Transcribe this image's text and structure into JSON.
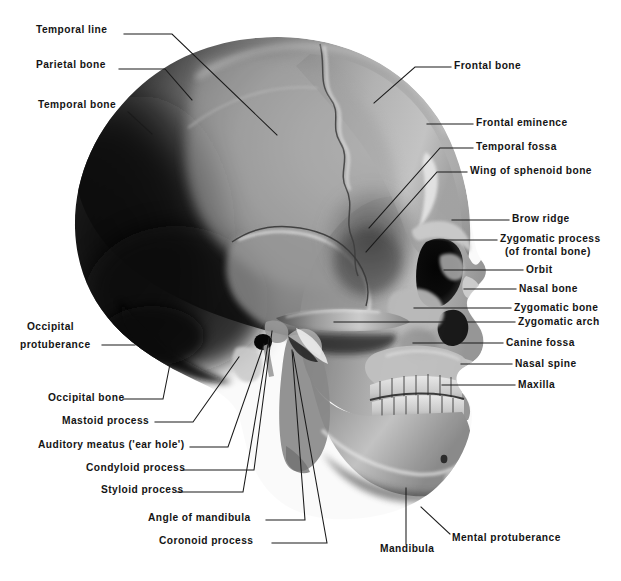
{
  "figure": {
    "width": 621,
    "height": 581,
    "background_color": "#ffffff",
    "text_color": "#141414",
    "leader_line_color": "#1a1a1a",
    "illustration_style": "grayscale airbrush / halftone anatomical plate"
  },
  "labels_left": [
    {
      "id": "temporal-line",
      "text": "Temporal line",
      "x": 36,
      "y": 30,
      "align": "left"
    },
    {
      "id": "parietal-bone",
      "text": "Parietal bone",
      "x": 36,
      "y": 65,
      "align": "left"
    },
    {
      "id": "temporal-bone",
      "text": "Temporal bone",
      "x": 38,
      "y": 105,
      "align": "left"
    },
    {
      "id": "occipital-line1",
      "text": "Occipital",
      "x": 27,
      "y": 327,
      "align": "left"
    },
    {
      "id": "occipital-line2",
      "text": "protuberance",
      "x": 20,
      "y": 345,
      "align": "left"
    },
    {
      "id": "occipital-bone",
      "text": "Occipital bone",
      "x": 48,
      "y": 398,
      "align": "left"
    },
    {
      "id": "mastoid-process",
      "text": "Mastoid process",
      "x": 62,
      "y": 421,
      "align": "left"
    },
    {
      "id": "auditory-meatus",
      "text": "Auditory meatus ('ear hole')",
      "x": 38,
      "y": 445,
      "align": "left"
    },
    {
      "id": "condyloid-process",
      "text": "Condyloid process",
      "x": 86,
      "y": 468,
      "align": "left"
    },
    {
      "id": "styloid-process",
      "text": "Styloid process",
      "x": 101,
      "y": 490,
      "align": "left"
    },
    {
      "id": "angle-of-mandibula",
      "text": "Angle of mandibula",
      "x": 148,
      "y": 518,
      "align": "left"
    },
    {
      "id": "coronoid-process",
      "text": "Coronoid process",
      "x": 159,
      "y": 541,
      "align": "left"
    }
  ],
  "labels_right": [
    {
      "id": "frontal-bone",
      "text": "Frontal bone",
      "x": 454,
      "y": 65,
      "align": "left"
    },
    {
      "id": "frontal-eminence",
      "text": "Frontal eminence",
      "x": 476,
      "y": 121,
      "align": "left"
    },
    {
      "id": "temporal-fossa",
      "text": "Temporal fossa",
      "x": 476,
      "y": 145,
      "align": "left"
    },
    {
      "id": "wing-of-sphenoid",
      "text": "Wing of sphenoid bone",
      "x": 470,
      "y": 169,
      "align": "left"
    },
    {
      "id": "brow-ridge",
      "text": "Brow ridge",
      "x": 512,
      "y": 217,
      "align": "left"
    },
    {
      "id": "zygomatic-process-1",
      "text": "Zygomatic process",
      "x": 500,
      "y": 237,
      "align": "left"
    },
    {
      "id": "zygomatic-process-2",
      "text": "(of frontal bone)",
      "x": 505,
      "y": 250,
      "align": "left"
    },
    {
      "id": "orbit",
      "text": "Orbit",
      "x": 526,
      "y": 268,
      "align": "left"
    },
    {
      "id": "nasal-bone",
      "text": "Nasal bone",
      "x": 519,
      "y": 287,
      "align": "left"
    },
    {
      "id": "zygomatic-bone",
      "text": "Zygomatic bone",
      "x": 514,
      "y": 306,
      "align": "left"
    },
    {
      "id": "zygomatic-arch",
      "text": "Zygomatic arch",
      "x": 518,
      "y": 320,
      "align": "left"
    },
    {
      "id": "canine-fossa",
      "text": "Canine fossa",
      "x": 506,
      "y": 341,
      "align": "left"
    },
    {
      "id": "nasal-spine",
      "text": "Nasal spine",
      "x": 515,
      "y": 362,
      "align": "left"
    },
    {
      "id": "maxilla",
      "text": "Maxilla",
      "x": 518,
      "y": 383,
      "align": "left"
    }
  ],
  "labels_bottom": [
    {
      "id": "mandibula",
      "text": "Mandibula",
      "x": 380,
      "y": 549,
      "align": "left"
    },
    {
      "id": "mental-protuberance",
      "text": "Mental protuberance",
      "x": 452,
      "y": 538,
      "align": "left"
    }
  ],
  "leader_lines": [
    {
      "id": "leader-temporal-line",
      "points": "124,34 172,34 277,135"
    },
    {
      "id": "leader-parietal-bone",
      "points": "119,69 165,69 192,100"
    },
    {
      "id": "leader-temporal-bone",
      "points": "128,112 150,132"
    },
    {
      "id": "leader-occipital-prot",
      "points": "102,345 135,345"
    },
    {
      "id": "leader-occipital-bone",
      "points": "123,399 163,399 168,366"
    },
    {
      "id": "leader-mastoid-process",
      "points": "155,422 193,422 238,358"
    },
    {
      "id": "leader-auditory-meatus",
      "points": "190,447 228,447 265,343"
    },
    {
      "id": "leader-condyloid-process",
      "points": "183,470 254,470 273,330"
    },
    {
      "id": "leader-styloid-process",
      "points": "177,492 243,492 270,337"
    },
    {
      "id": "leader-angle-mandibula",
      "points": "266,520 305,520 320,346"
    },
    {
      "id": "leader-coronoid-process",
      "points": "272,543 327,543 288,347"
    },
    {
      "id": "leader-frontal-bone",
      "points": "451,67 415,67 374,103"
    },
    {
      "id": "leader-frontal-eminence",
      "points": "473,124 427,124"
    },
    {
      "id": "leader-temporal-fossa",
      "points": "473,148 440,148 369,228"
    },
    {
      "id": "leader-wing-sphenoid",
      "points": "467,172 437,172 366,252"
    },
    {
      "id": "leader-brow-ridge",
      "points": "509,220 452,220"
    },
    {
      "id": "leader-zygomatic-process",
      "points": "497,240 443,240"
    },
    {
      "id": "leader-orbit",
      "points": "523,270 444,270"
    },
    {
      "id": "leader-nasal-bone",
      "points": "516,289 464,289"
    },
    {
      "id": "leader-zygomatic-bone",
      "points": "511,308 414,308"
    },
    {
      "id": "leader-zygomatic-arch",
      "points": "515,322 334,322"
    },
    {
      "id": "leader-canine-fossa",
      "points": "503,343 413,343"
    },
    {
      "id": "leader-nasal-spine",
      "points": "512,364 461,364"
    },
    {
      "id": "leader-maxilla",
      "points": "515,385 442,385"
    },
    {
      "id": "leader-mandibula",
      "points": "406,544 406,488"
    },
    {
      "id": "leader-mental-prot",
      "points": "450,534 421,507"
    }
  ],
  "illustration": {
    "name": "skull-lateral-illustration",
    "description": "Airbrushed grayscale lateral (side) view of a human skull facing right, with cranial sutures, orbit, nasal aperture, zygomatic arch, maxilla, teeth and mandible visible.",
    "tones": {
      "occipital_shadow": "#0d0d0d",
      "temporal_dark": "#2b2b2b",
      "parietal_mid": "#9d9d9d",
      "frontal_light": "#b4b4b4",
      "highlight": "#f2f2f2",
      "facial_mid": "#8e8e8e",
      "mandible_light": "#c0c0c0",
      "cavity_black": "#0a0a0a",
      "teeth": "#d9d9d9"
    }
  }
}
